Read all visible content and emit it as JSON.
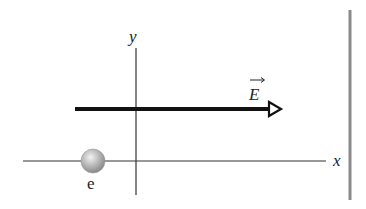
{
  "diagram": {
    "type": "physics-free-body",
    "axes": {
      "x_label": "x",
      "y_label": "y",
      "origin": [
        136,
        161
      ],
      "x_axis": {
        "x1": 23,
        "x2": 326,
        "y": 161
      },
      "y_axis": {
        "x": 136,
        "y1": 48,
        "y2": 195
      }
    },
    "field": {
      "label": "E",
      "vector_symbol": true,
      "direction": "+x",
      "y": 109,
      "x1": 75,
      "x2": 281
    },
    "particle": {
      "label": "e",
      "cx": 93,
      "cy": 161,
      "r": 12
    },
    "plate": {
      "x": 350,
      "y1": 10,
      "y2": 200
    },
    "colors": {
      "axis": "#333333",
      "field_arrow": "#111111",
      "plate": "#8a8a8a",
      "particle_light": "#e6e6e6",
      "particle_dark": "#8c8c8c",
      "text": "#222222"
    }
  }
}
